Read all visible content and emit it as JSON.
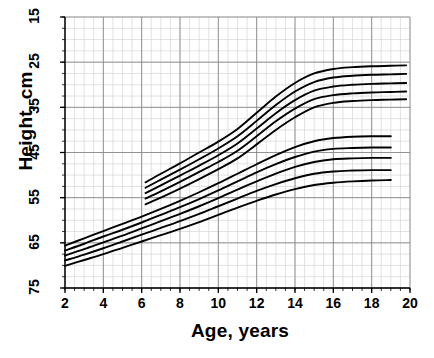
{
  "chart_data": {
    "type": "line",
    "title": "",
    "xlabel": "Age, years",
    "ylabel": "Height, cm",
    "xlim": [
      2,
      20
    ],
    "ylim": [
      15,
      75
    ],
    "xticks": [
      2,
      4,
      6,
      8,
      10,
      12,
      14,
      16,
      18,
      20
    ],
    "yticks": [
      15,
      25,
      35,
      45,
      55,
      65,
      75
    ],
    "grid": true,
    "minor_grid": true,
    "minor_ticks_per_major_x": 4,
    "minor_ticks_per_major_y": 4,
    "legend": "none",
    "line_color": "#000000",
    "grid_color_major": "#8a8a8a",
    "grid_color_minor": "#d6d6d6",
    "background": "#ffffff",
    "annotations": [],
    "series": [
      {
        "name": "upper-group-p95",
        "group": "upper",
        "x": [
          6.2,
          7,
          8,
          9,
          10,
          11,
          12,
          13,
          14,
          15,
          16,
          17,
          18,
          19,
          19.8
        ],
        "y": [
          38.4,
          40.3,
          42.6,
          45.0,
          47.4,
          50.2,
          53.8,
          57.4,
          60.4,
          62.5,
          63.5,
          63.9,
          64.1,
          64.2,
          64.3
        ]
      },
      {
        "name": "upper-group-p75",
        "group": "upper",
        "x": [
          6.2,
          7,
          8,
          9,
          10,
          11,
          12,
          13,
          14,
          15,
          16,
          17,
          18,
          19,
          19.8
        ],
        "y": [
          37.2,
          39.0,
          41.2,
          43.5,
          45.9,
          48.6,
          52.0,
          55.5,
          58.5,
          60.6,
          61.6,
          62.0,
          62.2,
          62.3,
          62.4
        ]
      },
      {
        "name": "upper-group-p50",
        "group": "upper",
        "x": [
          6.2,
          7,
          8,
          9,
          10,
          11,
          12,
          13,
          14,
          15,
          16,
          17,
          18,
          19,
          19.8
        ],
        "y": [
          36.0,
          37.7,
          39.9,
          42.1,
          44.4,
          47.0,
          50.3,
          53.7,
          56.6,
          58.7,
          59.6,
          60.0,
          60.2,
          60.3,
          60.4
        ]
      },
      {
        "name": "upper-group-p25",
        "group": "upper",
        "x": [
          6.2,
          7,
          8,
          9,
          10,
          11,
          12,
          13,
          14,
          15,
          16,
          17,
          18,
          19,
          19.8
        ],
        "y": [
          34.8,
          36.4,
          38.5,
          40.7,
          42.9,
          45.4,
          48.6,
          51.9,
          54.7,
          56.8,
          57.7,
          58.1,
          58.3,
          58.4,
          58.5
        ]
      },
      {
        "name": "upper-group-p05",
        "group": "upper",
        "x": [
          6.2,
          7,
          8,
          9,
          10,
          11,
          12,
          13,
          14,
          15,
          16,
          17,
          18,
          19,
          19.8
        ],
        "y": [
          33.5,
          35.0,
          37.0,
          39.1,
          41.3,
          43.7,
          46.8,
          50.0,
          52.8,
          55.0,
          56.0,
          56.4,
          56.6,
          56.7,
          56.8
        ]
      },
      {
        "name": "lower-group-p95",
        "group": "lower",
        "x": [
          2,
          3,
          4,
          5,
          6,
          7,
          8,
          9,
          10,
          11,
          12,
          13,
          14,
          15,
          16,
          17,
          18,
          19
        ],
        "y": [
          24.4,
          26.0,
          27.6,
          29.2,
          30.8,
          32.5,
          34.3,
          36.2,
          38.2,
          40.3,
          42.4,
          44.4,
          46.2,
          47.5,
          48.2,
          48.5,
          48.6,
          48.6
        ]
      },
      {
        "name": "lower-group-p75",
        "group": "lower",
        "x": [
          2,
          3,
          4,
          5,
          6,
          7,
          8,
          9,
          10,
          11,
          12,
          13,
          14,
          15,
          16,
          17,
          18,
          19
        ],
        "y": [
          23.3,
          24.8,
          26.4,
          27.9,
          29.5,
          31.2,
          32.9,
          34.7,
          36.6,
          38.6,
          40.6,
          42.4,
          44.0,
          45.2,
          45.8,
          46.0,
          46.1,
          46.1
        ]
      },
      {
        "name": "lower-group-p50",
        "group": "lower",
        "x": [
          2,
          3,
          4,
          5,
          6,
          7,
          8,
          9,
          10,
          11,
          12,
          13,
          14,
          15,
          16,
          17,
          18,
          19
        ],
        "y": [
          22.2,
          23.6,
          25.1,
          26.6,
          28.2,
          29.8,
          31.4,
          33.1,
          34.9,
          36.8,
          38.6,
          40.3,
          41.8,
          42.9,
          43.5,
          43.7,
          43.8,
          43.8
        ]
      },
      {
        "name": "lower-group-p25",
        "group": "lower",
        "x": [
          2,
          3,
          4,
          5,
          6,
          7,
          8,
          9,
          10,
          11,
          12,
          13,
          14,
          15,
          16,
          17,
          18,
          19
        ],
        "y": [
          21.1,
          22.4,
          23.8,
          25.3,
          26.8,
          28.3,
          29.8,
          31.4,
          33.1,
          34.8,
          36.5,
          38.0,
          39.3,
          40.3,
          40.8,
          41.0,
          41.1,
          41.1
        ]
      },
      {
        "name": "lower-group-p05",
        "group": "lower",
        "x": [
          2,
          3,
          4,
          5,
          6,
          7,
          8,
          9,
          10,
          11,
          12,
          13,
          14,
          15,
          16,
          17,
          18,
          19
        ],
        "y": [
          19.9,
          21.2,
          22.5,
          23.9,
          25.3,
          26.7,
          28.1,
          29.6,
          31.2,
          32.8,
          34.3,
          35.7,
          36.9,
          37.8,
          38.3,
          38.6,
          38.8,
          38.9
        ]
      }
    ]
  },
  "axes": {
    "y_title": "Height, cm",
    "x_title": "Age, years",
    "y_tick_labels": [
      "75",
      "65",
      "55",
      "45",
      "35",
      "25",
      "15"
    ],
    "x_tick_labels": [
      "2",
      "4",
      "6",
      "8",
      "10",
      "12",
      "14",
      "16",
      "18",
      "20"
    ]
  }
}
